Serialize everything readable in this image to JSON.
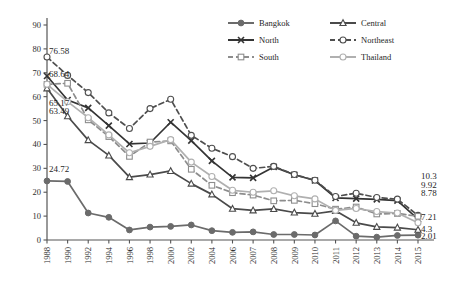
{
  "chart_data": {
    "type": "line",
    "title": "",
    "xlabel": "",
    "ylabel": "",
    "ylim": [
      0,
      90
    ],
    "ytick_step": 10,
    "grid": false,
    "legend_position": "top-right",
    "yticks": [
      "0",
      "10",
      "20",
      "30",
      "40",
      "50",
      "60",
      "70",
      "80",
      "90"
    ],
    "categories": [
      "1988",
      "1990",
      "1992",
      "1994",
      "1996",
      "1998",
      "2000",
      "2002",
      "2004",
      "2006",
      "2007",
      "2008",
      "2009",
      "2010",
      "2011",
      "2012",
      "2013",
      "2014",
      "2015"
    ],
    "series": [
      {
        "name": "Bangkok",
        "color": "#6b6b6b",
        "marker": "filled-circle",
        "dash": "solid",
        "values": [
          24.72,
          24.5,
          11.3,
          9.5,
          4.2,
          5.4,
          5.7,
          6.3,
          3.9,
          3.2,
          3.4,
          2.3,
          2.3,
          2.1,
          8.0,
          1.6,
          1.2,
          1.9,
          2.01
        ]
      },
      {
        "name": "Central",
        "color": "#4a4a4a",
        "marker": "open-triangle",
        "dash": "solid",
        "values": [
          63.49,
          51.8,
          41.8,
          35.4,
          26.3,
          27.4,
          28.9,
          23.6,
          19.1,
          13.1,
          12.4,
          13.0,
          11.5,
          11.0,
          12.2,
          7.2,
          5.5,
          5.2,
          4.3
        ]
      },
      {
        "name": "North",
        "color": "#343434",
        "marker": "x",
        "dash": "solid",
        "values": [
          68.64,
          58.6,
          55.3,
          47.9,
          40.2,
          40.6,
          49.3,
          41.6,
          33.1,
          26.2,
          26.0,
          30.6,
          27.3,
          24.9,
          17.6,
          17.3,
          17.0,
          16.5,
          8.78
        ]
      },
      {
        "name": "Northeast",
        "color": "#4f4f4f",
        "marker": "open-circle",
        "dash": "dashed",
        "values": [
          76.58,
          68.9,
          61.7,
          53.2,
          46.7,
          55.0,
          58.9,
          43.8,
          38.4,
          34.9,
          30.0,
          30.8,
          27.4,
          25.0,
          18.2,
          19.6,
          17.8,
          17.1,
          10.3
        ]
      },
      {
        "name": "South",
        "color": "#8d8d8d",
        "marker": "open-square",
        "dash": "dashed",
        "values": [
          65.17,
          65.6,
          50.3,
          43.3,
          35.0,
          41.0,
          41.5,
          29.6,
          22.9,
          19.8,
          18.8,
          16.4,
          16.6,
          15.2,
          12.9,
          13.8,
          10.9,
          11.1,
          9.92
        ]
      },
      {
        "name": "Thailand",
        "color": "#b0b0b0",
        "marker": "open-circle",
        "dash": "solid",
        "values": [
          65.17,
          57.9,
          51.2,
          44.0,
          36.5,
          39.2,
          42.0,
          32.6,
          26.6,
          20.8,
          20.0,
          20.6,
          18.5,
          17.2,
          12.4,
          13.2,
          11.9,
          11.3,
          7.21
        ]
      }
    ],
    "left_annotations": [
      {
        "text": "76.58",
        "value": 76.58
      },
      {
        "text": "68.64",
        "value": 68.64
      },
      {
        "text": "65.17",
        "value": 65.17
      },
      {
        "text": "63.49",
        "value": 63.49
      },
      {
        "text": "24.72",
        "value": 24.72
      }
    ],
    "right_annotations": [
      {
        "text": "10.3",
        "value": 10.3
      },
      {
        "text": "9.92",
        "value": 9.92
      },
      {
        "text": "8.78",
        "value": 8.78
      },
      {
        "text": "7.21",
        "value": 7.21
      },
      {
        "text": "4.3",
        "value": 4.3
      },
      {
        "text": "2.01",
        "value": 2.01
      }
    ],
    "legend": [
      {
        "label": "Bangkok",
        "marker": "filled-circle",
        "dash": "solid",
        "color": "#6b6b6b"
      },
      {
        "label": "Central",
        "marker": "open-triangle",
        "dash": "solid",
        "color": "#4a4a4a"
      },
      {
        "label": "North",
        "marker": "x",
        "dash": "solid",
        "color": "#343434"
      },
      {
        "label": "Northeast",
        "marker": "open-circle",
        "dash": "dashed",
        "color": "#4f4f4f"
      },
      {
        "label": "South",
        "marker": "open-square",
        "dash": "dashed",
        "color": "#8d8d8d"
      },
      {
        "label": "Thailand",
        "marker": "open-circle",
        "dash": "solid",
        "color": "#b0b0b0"
      }
    ]
  }
}
